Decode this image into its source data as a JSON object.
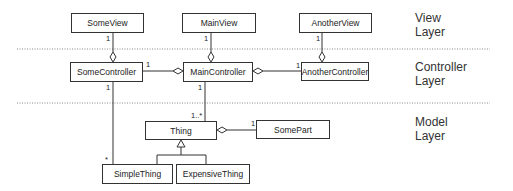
{
  "layers": [
    {
      "line1": "View",
      "line2": "Layer"
    },
    {
      "line1": "Controller",
      "line2": "Layer"
    },
    {
      "line1": "Model",
      "line2": "Layer"
    }
  ],
  "classes": {
    "some_view": "SomeView",
    "main_view": "MainView",
    "another_view": "AnotherView",
    "some_controller": "SomeController",
    "main_controller": "MainController",
    "another_controller": "AnotherController",
    "thing": "Thing",
    "some_part": "SomePart",
    "simple_thing": "SimpleThing",
    "expensive_thing": "ExpensiveThing"
  },
  "multiplicities": {
    "some_view_to_controller": "1",
    "main_view_to_controller": "1",
    "another_view_to_controller": "1",
    "some_controller_to_main": "1",
    "another_controller_to_main": "1",
    "some_controller_to_simple": "1",
    "simple_thing_end": "*",
    "main_controller_to_thing": "1",
    "thing_end": "1..*",
    "some_part_end": "1"
  },
  "colors": {
    "line": "#333333",
    "divider": "#888888"
  }
}
